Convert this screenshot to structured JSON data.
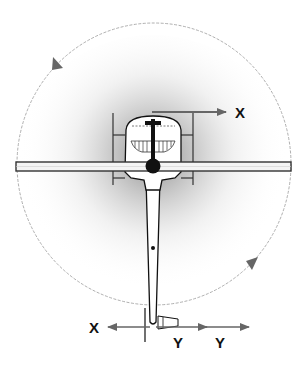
{
  "diagram": {
    "labels": {
      "top_x_axis": "X",
      "bottom_x_axis": "X",
      "bottom_y_axis_1": "Y",
      "bottom_y_axis_2": "Y"
    },
    "colors": {
      "background": "#ffffff",
      "outline": "#111111",
      "circle": "#9a9a9a",
      "arrow": "#666666",
      "shadow": "#8c8c8c",
      "wing_fill": "#f4f4f4"
    },
    "rotation_direction_arrows": 2
  }
}
